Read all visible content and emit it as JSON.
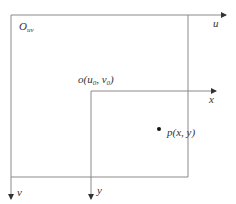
{
  "diagram": {
    "title": "",
    "colors": {
      "line": "#8a8a8a",
      "text": "#333333",
      "dot": "#111111"
    },
    "labels": {
      "origin_uv": "O",
      "origin_uv_sub": "uv",
      "origin_xy_prefix": "o(u",
      "origin_xy_sub0": "0",
      "origin_xy_mid": ", v",
      "origin_xy_sub1": "0",
      "origin_xy_suffix": ")",
      "axis_u": "u",
      "axis_v": "v",
      "axis_x": "x",
      "axis_y": "y",
      "point": "p(x, y)"
    }
  }
}
